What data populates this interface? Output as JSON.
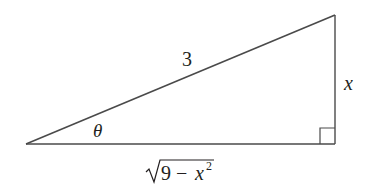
{
  "diagram": {
    "type": "right-triangle",
    "colors": {
      "stroke": "#4a4a4a",
      "text": "#231f20",
      "background": "#ffffff"
    },
    "labels": {
      "hypotenuse": "3",
      "opposite": "x",
      "angle": "θ",
      "adjacent_radicand_num": "9",
      "adjacent_minus": "−",
      "adjacent_var": "x",
      "adjacent_exp": "2"
    },
    "vertices": {
      "angle_vertex": [
        26,
        144
      ],
      "top_right": [
        335,
        15
      ],
      "right_angle": [
        335,
        144
      ]
    }
  }
}
